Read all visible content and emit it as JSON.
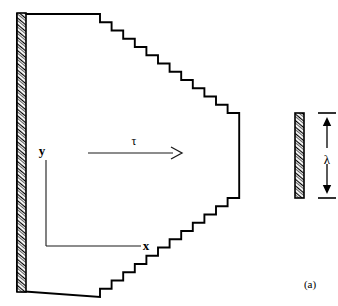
{
  "figure": {
    "caption": "(a)",
    "canvas": {
      "width": 338,
      "height": 306
    }
  },
  "labels": {
    "y_axis": "y",
    "x_axis": "x",
    "tau": "τ",
    "lambda": "λ"
  },
  "colors": {
    "outline": "#000000",
    "hatch": "#000000",
    "axis": "#1a1a1a",
    "background": "#ffffff",
    "text": "#000000"
  },
  "geometry": {
    "left_wall": {
      "x": 17,
      "y": 13,
      "width": 9,
      "height": 279
    },
    "right_wall": {
      "x": 295,
      "y": 113,
      "width": 9,
      "height": 85
    },
    "top_line": {
      "x1": 18,
      "y1": 14,
      "x2": 100,
      "y2": 14
    },
    "bottom_line": {
      "x1": 18,
      "y1": 291,
      "x2": 100,
      "y2": 291
    },
    "step_width": 11.6,
    "step_height": 8.25,
    "step_count": 12,
    "top_stair_start": {
      "x": 100,
      "y": 14
    },
    "bottom_stair_start": {
      "x": 100,
      "y": 291
    },
    "tau_arrow": {
      "x1": 88,
      "y": 153,
      "x2": 182
    },
    "tau_label_pos": {
      "x": 134,
      "y": 145
    },
    "y_axis": {
      "x": 46,
      "y1": 160,
      "y2": 246
    },
    "x_axis": {
      "y": 246,
      "x1": 46,
      "x2": 141
    },
    "y_label_pos": {
      "x": 42,
      "y": 155
    },
    "x_label_pos": {
      "x": 146,
      "y": 250
    },
    "lambda_dim": {
      "x": 327,
      "y_top": 113,
      "y_bottom": 198,
      "tick_half_width": 9
    },
    "lambda_label_pos": {
      "x": 327,
      "y": 160
    },
    "caption_pos": {
      "x": 310,
      "y": 288
    }
  },
  "chart_data": {
    "type": "diagram",
    "title": "(a)",
    "annotations": [
      {
        "name": "tau-arrow",
        "label": "τ",
        "meaning": "applied shear direction",
        "direction": "rightward"
      },
      {
        "name": "lambda-dimension",
        "label": "λ",
        "meaning": "height of right boundary",
        "direction": "vertical double arrow"
      },
      {
        "name": "y-axis",
        "label": "y",
        "direction": "up"
      },
      {
        "name": "x-axis",
        "label": "x",
        "direction": "right"
      }
    ],
    "regions": [
      {
        "name": "left-hatched-wall",
        "hatched": true,
        "orientation": "vertical"
      },
      {
        "name": "right-hatched-wall",
        "hatched": true,
        "orientation": "vertical"
      },
      {
        "name": "stepped-wedge-interior",
        "hatched": false
      }
    ]
  }
}
